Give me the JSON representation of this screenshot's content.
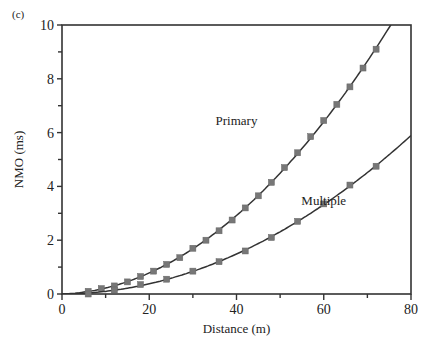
{
  "panel_label": "(c)",
  "chart_data": {
    "type": "line",
    "title": "",
    "xlabel": "Distance (m)",
    "ylabel": "NMO (ms)",
    "xlim": [
      0,
      80
    ],
    "ylim": [
      0,
      10
    ],
    "x_ticks": [
      0,
      20,
      40,
      60,
      80
    ],
    "y_ticks": [
      0,
      2,
      4,
      6,
      8,
      10
    ],
    "grid": false,
    "legend": "inline annotations",
    "series": [
      {
        "name": "Primary",
        "marker": "square",
        "x": [
          6,
          9,
          12,
          15,
          18,
          21,
          24,
          27,
          30,
          33,
          36,
          39,
          42,
          45,
          48,
          51,
          54,
          57,
          60,
          63,
          66,
          69,
          72
        ],
        "y": [
          0.1,
          0.2,
          0.3,
          0.45,
          0.65,
          0.85,
          1.1,
          1.35,
          1.7,
          2.0,
          2.35,
          2.75,
          3.2,
          3.65,
          4.15,
          4.7,
          5.25,
          5.85,
          6.45,
          7.05,
          7.7,
          8.4,
          9.1
        ]
      },
      {
        "name": "Multiple",
        "marker": "square",
        "x": [
          6,
          12,
          18,
          24,
          30,
          36,
          42,
          48,
          54,
          60,
          66,
          72
        ],
        "y": [
          0.0,
          0.15,
          0.35,
          0.55,
          0.85,
          1.2,
          1.6,
          2.1,
          2.7,
          3.35,
          4.05,
          4.75
        ]
      }
    ],
    "annotations": [
      {
        "text": "Primary",
        "x": 40,
        "y": 6.3
      },
      {
        "text": "Multiple",
        "x": 60,
        "y": 3.3
      }
    ]
  }
}
